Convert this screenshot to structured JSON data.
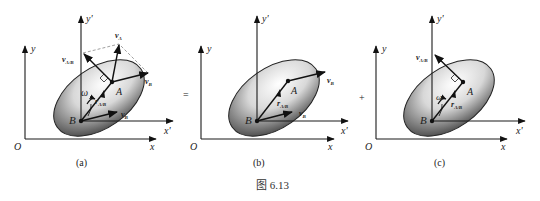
{
  "figure": {
    "caption": "图 6.13",
    "operators": [
      "=",
      "+"
    ],
    "panels": [
      {
        "id": "a",
        "label": "(a)",
        "axes": {
          "origin": "O",
          "x": "x",
          "y": "y",
          "x_prime": "x'",
          "y_prime": "y'"
        },
        "points": {
          "A": "A",
          "B": "B"
        },
        "vectors": {
          "v_A": "v",
          "v_A_sub": "A",
          "v_B": "v",
          "v_B_sub": "B",
          "v_B2": "v",
          "v_B2_sub": "B",
          "v_AB": "v",
          "v_AB_sub": "A/B",
          "r_AB": "r",
          "r_AB_sub": "A/B"
        },
        "omega": "ω"
      },
      {
        "id": "b",
        "label": "(b)",
        "axes": {
          "origin": "O",
          "x": "x",
          "y": "y",
          "x_prime": "x'",
          "y_prime": "y'"
        },
        "points": {
          "A": "A",
          "B": "B"
        },
        "vectors": {
          "v_B": "v",
          "v_B_sub": "B",
          "v_B2": "v",
          "v_B2_sub": "B",
          "r_AB": "r",
          "r_AB_sub": "A/B"
        }
      },
      {
        "id": "c",
        "label": "(c)",
        "axes": {
          "origin": "O",
          "x": "x",
          "y": "y",
          "x_prime": "x'",
          "y_prime": "y'"
        },
        "points": {
          "A": "A",
          "B": "B"
        },
        "vectors": {
          "v_AB": "v",
          "v_AB_sub": "A/B",
          "r_AB": "r",
          "r_AB_sub": "A/B"
        },
        "omega": "ω"
      }
    ]
  }
}
